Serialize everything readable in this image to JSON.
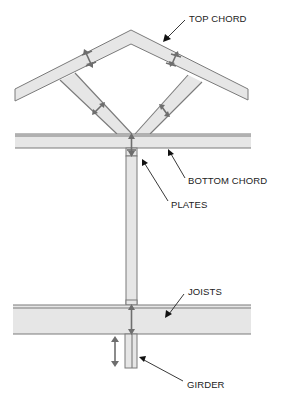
{
  "diagram": {
    "labels": {
      "top_chord": "TOP CHORD",
      "bottom_chord": "BOTTOM CHORD",
      "plates": "PLATES",
      "joists": "JOISTS",
      "girder": "GIRDER"
    },
    "components": [
      {
        "name": "top-chord",
        "label": "TOP CHORD"
      },
      {
        "name": "web-members",
        "label": ""
      },
      {
        "name": "bottom-chord",
        "label": "BOTTOM CHORD"
      },
      {
        "name": "plates",
        "label": "PLATES"
      },
      {
        "name": "post",
        "label": ""
      },
      {
        "name": "joists",
        "label": "JOISTS"
      },
      {
        "name": "girder",
        "label": "GIRDER"
      }
    ],
    "colors": {
      "member_fill": "#e6e6e6",
      "member_stroke": "#7a7a7a",
      "load_arrow": "#6e6e6e",
      "leader": "#222222",
      "text": "#222222"
    }
  }
}
